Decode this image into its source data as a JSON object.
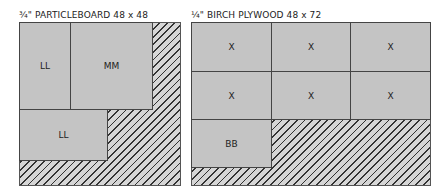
{
  "sheets": [
    {
      "title": "¾\" PARTICLEBOARD  48 x 48",
      "material": "¾\" PARTICLEBOARD",
      "dimensions": "48 x 48",
      "pieces": [
        {
          "label": "LL"
        },
        {
          "label": "MM"
        },
        {
          "label": "LL"
        }
      ]
    },
    {
      "title": "¼\" BIRCH PLYWOOD  48 x 72",
      "material": "¼\" BIRCH PLYWOOD",
      "dimensions": "48 x 72",
      "pieces": [
        {
          "label": "X"
        },
        {
          "label": "X"
        },
        {
          "label": "X"
        },
        {
          "label": "X"
        },
        {
          "label": "X"
        },
        {
          "label": "X"
        },
        {
          "label": "BB"
        }
      ]
    }
  ],
  "colors": {
    "piece_fill": "#c4c4c4",
    "waste_hatch": "#333333",
    "outline": "#444444"
  }
}
